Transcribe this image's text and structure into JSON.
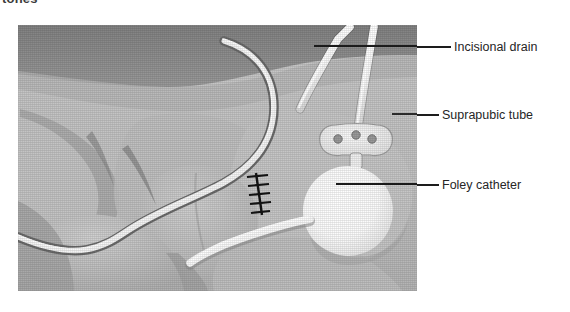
{
  "caption": {
    "clipped_top_text": "tones"
  },
  "figure": {
    "panel": {
      "x": 18,
      "y": 25,
      "width": 399,
      "height": 266,
      "background_color": "#b9b9b9"
    },
    "illustration_parts": [
      {
        "name": "abdominal-wall-skin",
        "color": "#c3c3c3"
      },
      {
        "name": "upper-dark-band",
        "color": "#8d8d8d"
      },
      {
        "name": "thigh-left",
        "color": "#c9c9c9"
      },
      {
        "name": "thigh-right",
        "color": "#c6c6c6"
      },
      {
        "name": "scrotum",
        "color": "#c8c8c8"
      },
      {
        "name": "surgical-incision-sutures",
        "color": "#1c1c1c"
      },
      {
        "name": "foley-balloon",
        "color": "#fdfdfd"
      },
      {
        "name": "suprapubic-securement-disc",
        "color": "#f2f2f2"
      },
      {
        "name": "drain-tube",
        "color": "#fafafa"
      },
      {
        "name": "catheter-tube",
        "color": "#f7f7f7"
      }
    ]
  },
  "callouts": [
    {
      "id": "incisional-drain",
      "label": "Incisional drain",
      "leader_color": "#1d1d1d"
    },
    {
      "id": "suprapubic-tube",
      "label": "Suprapubic tube",
      "leader_color": "#1d1d1d"
    },
    {
      "id": "foley-catheter",
      "label": "Foley catheter",
      "leader_color": "#1d1d1d"
    }
  ],
  "colors": {
    "text": "#262626",
    "leader": "#1d1d1d",
    "panel_bg": "#b9b9b9",
    "tube_white": "#fbfbfb",
    "dark_band": "#8d8d8d"
  }
}
